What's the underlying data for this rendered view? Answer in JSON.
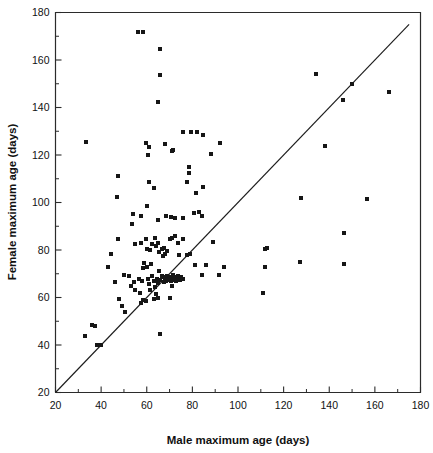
{
  "chart_data": {
    "type": "scatter",
    "title": "",
    "xlabel": "Male maximum age (days)",
    "ylabel": "Female maximum age (days)",
    "xlim": [
      20,
      180
    ],
    "ylim": [
      20,
      180
    ],
    "xticks": [
      20,
      40,
      60,
      80,
      100,
      120,
      140,
      160,
      180
    ],
    "yticks": [
      20,
      40,
      60,
      80,
      100,
      120,
      140,
      160,
      180
    ],
    "xtick_labels": [
      "20",
      "40",
      "60",
      "80",
      "100",
      "120",
      "140",
      "160",
      "180"
    ],
    "ytick_labels": [
      "20",
      "40",
      "60",
      "80",
      "100",
      "120",
      "140",
      "160",
      "180"
    ],
    "minor_tick_step": 10,
    "grid": false,
    "legend": null,
    "marker": "square",
    "marker_color": "#161616",
    "marker_size_px": 4,
    "annotations": [
      {
        "type": "line",
        "name": "identity-line",
        "label": "y = x reference line",
        "x": [
          20,
          175
        ],
        "y": [
          20,
          175
        ]
      }
    ],
    "points": [
      [
        56,
        172
      ],
      [
        58.5,
        172
      ],
      [
        66,
        164.5
      ],
      [
        66,
        153.5
      ],
      [
        65,
        142.5
      ],
      [
        33.5,
        125.5
      ],
      [
        59.5,
        125
      ],
      [
        61,
        123.5
      ],
      [
        60.5,
        120
      ],
      [
        68,
        124.5
      ],
      [
        71.5,
        122
      ],
      [
        71,
        121.5
      ],
      [
        76,
        129.5
      ],
      [
        79.5,
        129.5
      ],
      [
        82,
        129.5
      ],
      [
        84.5,
        128.5
      ],
      [
        78.5,
        115
      ],
      [
        78.5,
        112.5
      ],
      [
        77.5,
        108.5
      ],
      [
        81.5,
        104
      ],
      [
        84.5,
        106.5
      ],
      [
        88,
        120.5
      ],
      [
        92,
        125
      ],
      [
        47.5,
        111
      ],
      [
        47,
        102.5
      ],
      [
        61,
        108.5
      ],
      [
        63,
        106
      ],
      [
        54,
        95
      ],
      [
        57.5,
        94.5
      ],
      [
        60,
        98.5
      ],
      [
        53.5,
        91
      ],
      [
        65,
        92.5
      ],
      [
        68.5,
        94.5
      ],
      [
        70.5,
        94
      ],
      [
        72.5,
        93.5
      ],
      [
        76,
        93.5
      ],
      [
        80.5,
        95.5
      ],
      [
        83,
        96
      ],
      [
        84,
        94.5
      ],
      [
        47.5,
        84.5
      ],
      [
        44.5,
        78.5
      ],
      [
        55,
        82.5
      ],
      [
        57.5,
        83
      ],
      [
        59.5,
        84.5
      ],
      [
        60,
        80.5
      ],
      [
        61.5,
        80
      ],
      [
        62.5,
        82.5
      ],
      [
        63.5,
        85
      ],
      [
        64,
        81.5
      ],
      [
        65,
        83
      ],
      [
        65.5,
        79
      ],
      [
        66.5,
        80.5
      ],
      [
        67,
        77.5
      ],
      [
        67.5,
        81
      ],
      [
        68,
        78.5
      ],
      [
        69,
        79.5
      ],
      [
        70,
        84.5
      ],
      [
        71,
        85
      ],
      [
        72.5,
        86
      ],
      [
        73.5,
        83
      ],
      [
        76,
        84.5
      ],
      [
        74,
        78
      ],
      [
        77.5,
        78
      ],
      [
        89,
        83.5
      ],
      [
        112,
        80.5
      ],
      [
        112.5,
        81
      ],
      [
        43,
        73
      ],
      [
        46,
        66.5
      ],
      [
        50,
        69.5
      ],
      [
        52,
        69
      ],
      [
        53,
        65
      ],
      [
        54.5,
        66.5
      ],
      [
        55,
        63
      ],
      [
        56.5,
        68
      ],
      [
        57,
        62
      ],
      [
        58,
        67
      ],
      [
        58.5,
        72.5
      ],
      [
        59,
        74.5
      ],
      [
        60,
        73
      ],
      [
        60.5,
        68
      ],
      [
        61,
        65.5
      ],
      [
        61.5,
        63
      ],
      [
        62,
        74
      ],
      [
        62.5,
        69
      ],
      [
        63,
        67
      ],
      [
        63.5,
        64.5
      ],
      [
        64,
        61.5
      ],
      [
        64.5,
        68
      ],
      [
        65,
        66
      ],
      [
        65.5,
        71
      ],
      [
        66,
        67.5
      ],
      [
        66.5,
        69
      ],
      [
        67,
        68.5
      ],
      [
        67.5,
        66.5
      ],
      [
        68,
        68
      ],
      [
        68.5,
        67
      ],
      [
        69,
        69
      ],
      [
        69.5,
        67.5
      ],
      [
        70,
        68.5
      ],
      [
        70.5,
        67
      ],
      [
        71,
        68
      ],
      [
        71.5,
        69.5
      ],
      [
        72,
        67.5
      ],
      [
        72.5,
        68.5
      ],
      [
        73,
        67
      ],
      [
        73.5,
        69
      ],
      [
        74,
        68
      ],
      [
        74.5,
        67.5
      ],
      [
        75,
        68.5
      ],
      [
        76,
        68
      ],
      [
        63,
        59.5
      ],
      [
        65,
        60
      ],
      [
        70,
        60
      ],
      [
        71,
        65
      ],
      [
        57.5,
        57.5
      ],
      [
        58.5,
        59
      ],
      [
        59.5,
        58.5
      ],
      [
        49,
        56.5
      ],
      [
        50.5,
        54
      ],
      [
        48,
        59.5
      ],
      [
        81,
        73.5
      ],
      [
        84,
        69.5
      ],
      [
        86,
        73.5
      ],
      [
        79,
        78.5
      ],
      [
        91.5,
        69.5
      ],
      [
        94,
        73
      ],
      [
        36,
        48.5
      ],
      [
        37.5,
        48
      ],
      [
        33,
        44
      ],
      [
        38,
        40
      ],
      [
        40,
        40
      ],
      [
        66,
        44.5
      ],
      [
        111,
        62
      ],
      [
        112,
        73
      ],
      [
        127,
        75
      ],
      [
        127.5,
        102
      ],
      [
        134,
        154
      ],
      [
        138,
        124
      ],
      [
        146,
        143
      ],
      [
        146.5,
        87
      ],
      [
        146.5,
        74
      ],
      [
        150,
        150
      ],
      [
        156.5,
        101.5
      ],
      [
        166,
        146.5
      ]
    ]
  },
  "axes": {
    "x_title": "Male maximum age (days)",
    "y_title": "Female maximum age (days)"
  }
}
